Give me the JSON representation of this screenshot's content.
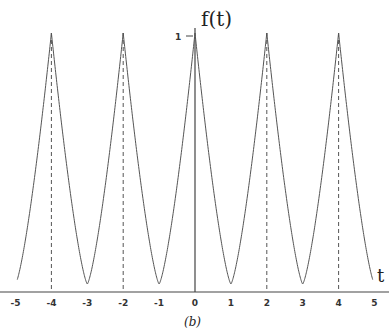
{
  "chart_data": {
    "type": "line",
    "title": "",
    "caption": "(b)",
    "xlabel": "t",
    "ylabel": "f(t)",
    "xlim": [
      -5.4,
      5.4
    ],
    "ylim": [
      0,
      1
    ],
    "x_ticks": [
      -5,
      -4,
      -3,
      -2,
      -1,
      0,
      1,
      2,
      3,
      4,
      5
    ],
    "x_tick_labels": [
      "-5",
      "-4",
      "-3",
      "-2",
      "-1",
      "0",
      "1",
      "2",
      "3",
      "4",
      "5"
    ],
    "y_ticks": [
      1
    ],
    "y_tick_labels": [
      "1"
    ],
    "grid": false,
    "dashed_reference_lines_x": [
      -4,
      -2,
      2,
      4
    ],
    "series": [
      {
        "name": "f(t)",
        "description": "periodic triangular-like wave with period 2, peaks of 1 at even t, minima of 0 at odd t",
        "x": [
          -5,
          -4,
          -3,
          -2,
          -1,
          0,
          1,
          2,
          3,
          4,
          5
        ],
        "y": [
          0,
          1,
          0,
          1,
          0,
          1,
          0,
          1,
          0,
          1,
          0
        ]
      }
    ]
  }
}
